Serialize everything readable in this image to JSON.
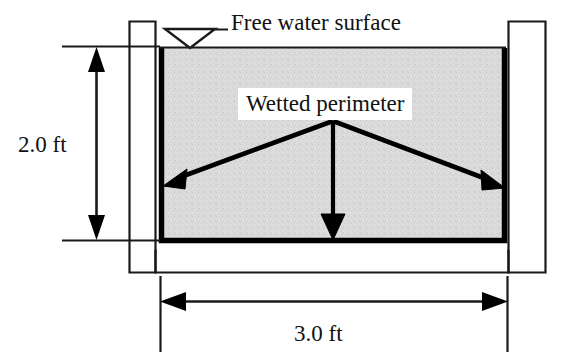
{
  "diagram": {
    "type": "open-channel-cross-section",
    "labels": {
      "free_water_surface": "Free water surface",
      "wetted_perimeter": "Wetted perimeter",
      "depth_dimension": "2.0 ft",
      "width_dimension": "3.0 ft"
    },
    "dimensions": {
      "depth_value": 2.0,
      "width_value": 3.0,
      "units": "ft"
    },
    "colors": {
      "water_fill": "#d9d9d9",
      "outline": "#000000",
      "background": "#ffffff",
      "text": "#111111"
    },
    "icons": {
      "water_surface_symbol": "water-surface-triangle-icon",
      "left_arrow": "wetted-perimeter-arrow-left",
      "right_arrow": "wetted-perimeter-arrow-right",
      "down_arrow": "wetted-perimeter-arrow-down"
    }
  }
}
